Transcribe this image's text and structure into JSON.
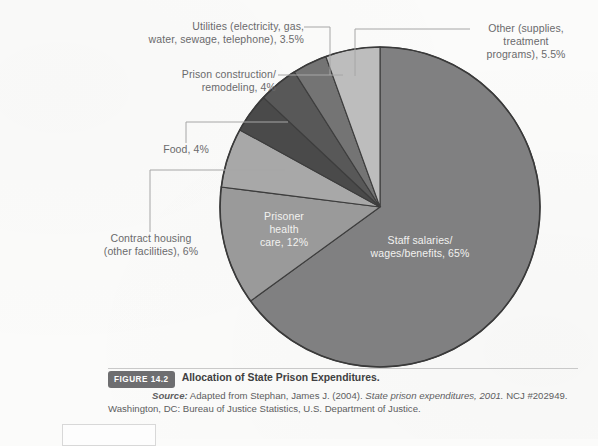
{
  "figure": {
    "badge": "FIGURE 14.2",
    "title": "Allocation of State Prison Expenditures.",
    "source_label": "Source:",
    "source_line1": " Adapted from Stephan, James J. (2004). ",
    "source_italic": "State prison expenditures, 2001.",
    "source_line1b": " NCJ #202949.",
    "source_line2": "Washington, DC: Bureau of Justice Statistics, U.S. Department of Justice."
  },
  "chart_data": {
    "type": "pie",
    "title": "Allocation of State Prison Expenditures.",
    "legend": "none",
    "units": "percent",
    "labels": [
      "Staff salaries/wages/benefits, 65%",
      "Prisoner health care, 12%",
      "Contract housing (other facilities), 6%",
      "Food, 4%",
      "Prison construction/remodeling, 4%",
      "Utilities (electricity, gas, water, sewage, telephone), 3.5%",
      "Other (supplies, treatment programs), 5.5%"
    ],
    "categories": [
      "Staff salaries/wages/benefits",
      "Prisoner health care",
      "Contract housing (other facilities)",
      "Food",
      "Prison construction/remodeling",
      "Utilities (electricity, gas, water, sewage, telephone)",
      "Other (supplies, treatment programs)"
    ],
    "values": [
      65,
      12,
      6,
      4,
      4,
      3.5,
      5.5
    ],
    "colors": [
      "#808081",
      "#9a9a9a",
      "#a8a8a8",
      "#4a4a4a",
      "#585858",
      "#747474",
      "#bdbdbd"
    ]
  },
  "slices": {
    "staff": {
      "name": "Staff salaries/wages/benefits",
      "value": 65,
      "label_line1": "Staff salaries/",
      "label_line2": "wages/benefits, 65%",
      "color": "#808081"
    },
    "health": {
      "name": "Prisoner health care",
      "value": 12,
      "label_line1": "Prisoner",
      "label_line2": "health",
      "label_line3": "care, 12%",
      "color": "#9a9a9a"
    },
    "contract": {
      "name": "Contract housing (other facilities)",
      "value": 6,
      "label_line1": "Contract housing",
      "label_line2": "(other facilities), 6%",
      "color": "#a8a8a8"
    },
    "food": {
      "name": "Food",
      "value": 4,
      "label_line1": "Food, 4%",
      "color": "#4a4a4a"
    },
    "construction": {
      "name": "Prison construction/remodeling",
      "value": 4,
      "label_line1": "Prison construction/",
      "label_line2": "remodeling, 4%",
      "color": "#585858"
    },
    "utilities": {
      "name": "Utilities",
      "value": 3.5,
      "label_line1": "Utilities (electricity, gas,",
      "label_line2": "water, sewage, telephone), 3.5%",
      "color": "#747474"
    },
    "other": {
      "name": "Other",
      "value": 5.5,
      "label_line1": "Other (supplies,",
      "label_line2": "treatment",
      "label_line3": "programs), 5.5%",
      "color": "#bdbdbd"
    }
  }
}
